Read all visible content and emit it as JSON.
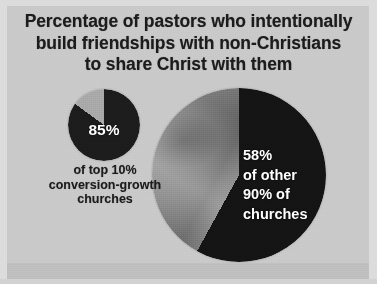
{
  "title": {
    "line1": "Percentage of pastors who intentionally",
    "line2": "build friendships with non-Christians",
    "line3": "to share Christ with them"
  },
  "small_pie": {
    "value_label": "85%",
    "caption_line1": "of top 10%",
    "caption_line2": "conversion-growth",
    "caption_line3": "churches"
  },
  "large_pie": {
    "value_label": "58%",
    "label_line2": "of other",
    "label_line3": "90% of",
    "label_line4": "churches"
  },
  "colors": {
    "background": "#c9c9c9",
    "edge": "#dcdcdc",
    "bottom_band": "#bfbfbf",
    "dark_slice": "#141414",
    "light_slice_small": "#a9a9a9",
    "gray_slice_large": "#8e8e8e",
    "title_text": "#1b1b1b",
    "slice_label_text": "#ffffff"
  },
  "chart_data": [
    {
      "type": "pie",
      "title": "Top 10% conversion-growth churches",
      "categories": [
        "Intentionally build friendships with non-Christians",
        "Do not"
      ],
      "values": [
        85,
        15
      ],
      "labels": [
        "85%",
        ""
      ],
      "units": "percent",
      "colors": [
        "#141414",
        "#a9a9a9"
      ],
      "start_angle_deg": 0,
      "direction": "clockwise",
      "legend": "none",
      "annotations": [
        "85%",
        "of top 10%",
        "conversion-growth",
        "churches"
      ]
    },
    {
      "type": "pie",
      "title": "Other 90% of churches",
      "categories": [
        "Intentionally build friendships with non-Christians",
        "Do not"
      ],
      "values": [
        58,
        42
      ],
      "labels": [
        "58%",
        ""
      ],
      "units": "percent",
      "colors": [
        "#141414",
        "#8e8e8e"
      ],
      "start_angle_deg": 0,
      "direction": "clockwise",
      "legend": "none",
      "annotations": [
        "58%",
        "of other",
        "90% of",
        "churches"
      ]
    }
  ]
}
